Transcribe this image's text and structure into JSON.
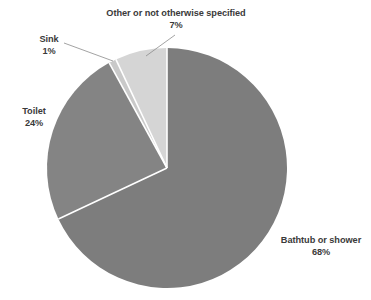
{
  "chart_data": {
    "type": "pie",
    "title": "",
    "subtitle": "",
    "xlabel": "",
    "ylabel": "",
    "legend_position": "none",
    "grid": false,
    "start_angle_deg": 0,
    "direction": "clockwise",
    "categories": [
      "Bathtub or shower",
      "Toilet",
      "Sink",
      "Other or not otherwise specified"
    ],
    "values": [
      68,
      24,
      1,
      7
    ],
    "value_labels": [
      "68%",
      "24%",
      "1%",
      "7%"
    ],
    "units": "percent",
    "colors": [
      "#7d7d7d",
      "#848484",
      "#c9c9c9",
      "#d5d5d5"
    ],
    "slices": [
      {
        "name": "Bathtub or shower",
        "value": 68,
        "value_label": "68%",
        "color": "#7d7d7d",
        "label_placement": "outside-right",
        "has_leader_line": false
      },
      {
        "name": "Toilet",
        "value": 24,
        "value_label": "24%",
        "color": "#848484",
        "label_placement": "outside-left",
        "has_leader_line": false
      },
      {
        "name": "Sink",
        "value": 1,
        "value_label": "1%",
        "color": "#c9c9c9",
        "label_placement": "outside-upper-left",
        "has_leader_line": true
      },
      {
        "name": "Other or not otherwise specified",
        "value": 7,
        "value_label": "7%",
        "color": "#d5d5d5",
        "label_placement": "outside-top",
        "has_leader_line": true
      }
    ]
  },
  "labels": {
    "other": {
      "name": "Other or not otherwise specified",
      "pct": "7%"
    },
    "sink": {
      "name": "Sink",
      "pct": "1%"
    },
    "toilet": {
      "name": "Toilet",
      "pct": "24%"
    },
    "bathtub": {
      "name": "Bathtub or shower",
      "pct": "68%"
    }
  },
  "style": {
    "background": "#ffffff",
    "text_color": "#3a3a3a",
    "leader_line_color": "#8c8c8c",
    "slice_border_color": "#ffffff"
  }
}
